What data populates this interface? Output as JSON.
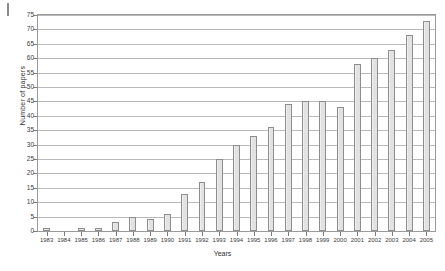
{
  "chart_data": {
    "type": "bar",
    "title": "",
    "xlabel": "Years",
    "ylabel": "Number of papers",
    "categories": [
      "1983",
      "1984",
      "1985",
      "1986",
      "1987",
      "1988",
      "1989",
      "1990",
      "1991",
      "1992",
      "1993",
      "1994",
      "1995",
      "1996",
      "1997",
      "1998",
      "1999",
      "2000",
      "2001",
      "2002",
      "2003",
      "2004",
      "2005"
    ],
    "values": [
      1,
      0,
      1,
      1,
      3,
      5,
      4,
      6,
      13,
      17,
      25,
      30,
      33,
      36,
      44,
      45,
      45,
      43,
      58,
      60,
      63,
      68,
      73
    ],
    "ylim": [
      0,
      75
    ],
    "ytick_labels": [
      "0",
      "5",
      "10",
      "15",
      "20",
      "25",
      "30",
      "35",
      "40",
      "45",
      "50",
      "55",
      "60",
      "65",
      "70",
      "75"
    ],
    "ytick_values": [
      0,
      5,
      10,
      15,
      20,
      25,
      30,
      35,
      40,
      45,
      50,
      55,
      60,
      65,
      70,
      75
    ],
    "grid": true,
    "legend": "none",
    "bar_fill_color": "#e9e9e9",
    "bar_border_color": "#8d8d8d",
    "gridline_color": "#b9b9b9",
    "axis_color": "#9a9a9a"
  }
}
